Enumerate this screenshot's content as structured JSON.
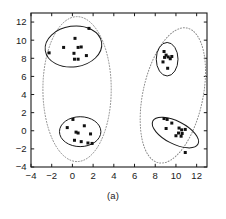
{
  "figure": {
    "caption": "(a)",
    "colors": {
      "point": "#111111",
      "inner_ellipse": "#1a1a1a",
      "outer_ellipse": "#8a8a8a",
      "axis": "#1a1a1a",
      "background": "#ffffff"
    }
  },
  "chart_data": {
    "type": "scatter",
    "title": "",
    "subtitle": "",
    "xlabel": "",
    "ylabel": "",
    "xlim": [
      -4,
      13
    ],
    "ylim": [
      -4,
      13
    ],
    "xticks": [
      -4,
      -2,
      0,
      2,
      4,
      6,
      8,
      10,
      12
    ],
    "yticks": [
      -4,
      -2,
      0,
      2,
      4,
      6,
      8,
      10,
      12
    ],
    "xtick_labels": [
      "-4",
      "-2",
      "0",
      "2",
      "4",
      "6",
      "8",
      "10",
      "12"
    ],
    "ytick_labels": [
      "-4",
      "-2",
      "0",
      "2",
      "4",
      "6",
      "8",
      "10",
      "12"
    ],
    "grid": false,
    "legend": null,
    "legend_position": "none",
    "annotations": [
      "(a)"
    ],
    "marker": "square",
    "marker_size": 3,
    "series": [
      {
        "name": "cluster-top-left",
        "values": [
          [
            -2.25,
            8.6
          ],
          [
            -0.85,
            9.2
          ],
          [
            0.25,
            10.2
          ],
          [
            0.55,
            9.2
          ],
          [
            0.85,
            9.25
          ],
          [
            0.15,
            8.55
          ],
          [
            1.6,
            11.3
          ],
          [
            1.35,
            8.3
          ],
          [
            0.2,
            7.9
          ],
          [
            0.55,
            7.9
          ]
        ]
      },
      {
        "name": "cluster-bottom-left",
        "values": [
          [
            0.05,
            1.25
          ],
          [
            -0.5,
            0.35
          ],
          [
            1.15,
            0.55
          ],
          [
            0.35,
            -0.15
          ],
          [
            0.55,
            -0.25
          ],
          [
            1.75,
            -0.35
          ],
          [
            0.2,
            -1.05
          ],
          [
            0.85,
            -1.2
          ],
          [
            1.5,
            -1.35
          ],
          [
            1.9,
            -1.4
          ]
        ]
      },
      {
        "name": "cluster-top-right",
        "values": [
          [
            8.85,
            8.75
          ],
          [
            9.05,
            8.35
          ],
          [
            8.9,
            8.1
          ],
          [
            9.25,
            8.15
          ],
          [
            9.6,
            8.2
          ],
          [
            9.45,
            7.95
          ],
          [
            8.75,
            7.6
          ],
          [
            9.2,
            6.9
          ]
        ]
      },
      {
        "name": "cluster-bottom-right",
        "values": [
          [
            8.85,
            1.35
          ],
          [
            9.15,
            1.25
          ],
          [
            9.6,
            0.85
          ],
          [
            9.05,
            0.25
          ],
          [
            10.3,
            0.3
          ],
          [
            10.55,
            0.1
          ],
          [
            10.9,
            0.15
          ],
          [
            10.25,
            -0.25
          ],
          [
            10.6,
            -0.3
          ],
          [
            10.0,
            -0.55
          ],
          [
            10.5,
            -0.6
          ],
          [
            10.9,
            -2.4
          ]
        ]
      }
    ],
    "inner_ellipses": [
      {
        "name": "inner-top-left",
        "cx": 0.1,
        "cy": 9.3,
        "rx": 2.75,
        "ry": 2.25,
        "angle": -8,
        "style": "solid"
      },
      {
        "name": "inner-bottom-left",
        "cx": 0.75,
        "cy": -0.1,
        "rx": 2.0,
        "ry": 1.65,
        "angle": 0,
        "style": "solid"
      },
      {
        "name": "inner-top-right",
        "cx": 9.15,
        "cy": 7.9,
        "rx": 1.05,
        "ry": 1.85,
        "angle": 0,
        "style": "solid"
      },
      {
        "name": "inner-bottom-right",
        "cx": 9.95,
        "cy": -0.2,
        "rx": 2.45,
        "ry": 1.25,
        "angle": 27,
        "style": "solid"
      }
    ],
    "outer_ellipses": [
      {
        "name": "outer-left",
        "cx": 0.45,
        "cy": 4.6,
        "rx": 3.3,
        "ry": 8.0,
        "angle": 0,
        "style": "dotted"
      },
      {
        "name": "outer-right",
        "cx": 9.7,
        "cy": 3.9,
        "rx": 2.9,
        "ry": 7.6,
        "angle": 12,
        "style": "dotted"
      }
    ]
  }
}
